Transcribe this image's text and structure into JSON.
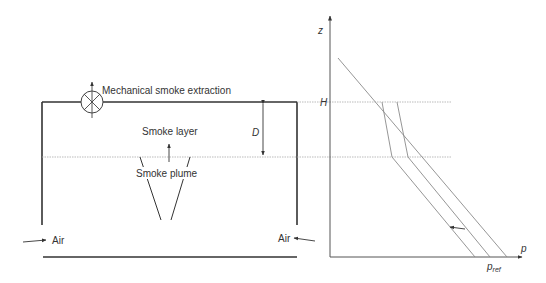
{
  "left_diagram": {
    "extraction_label": "Mechanical smoke extraction",
    "smoke_layer_label": "Smoke layer",
    "smoke_plume_label": "Smoke plume",
    "depth_label": "D",
    "air_left_label": "Air",
    "air_right_label": "Air"
  },
  "right_diagram": {
    "z_axis_label": "z",
    "p_axis_label": "p",
    "h_label": "H",
    "pref_label": "p",
    "pref_subscript": "ref"
  },
  "colors": {
    "wall": "#333333",
    "dotted_line": "#9a9a9a",
    "profile_line": "#8a8a8a",
    "text": "#333333"
  }
}
